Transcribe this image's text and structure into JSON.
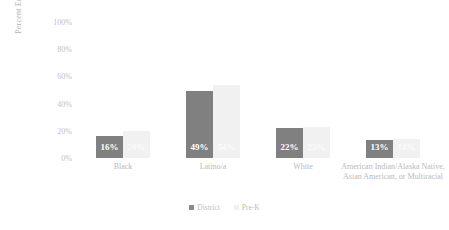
{
  "chart_data": {
    "type": "bar",
    "title": "",
    "xlabel": "",
    "ylabel": "Percent Enrollment",
    "ylim": [
      0,
      100
    ],
    "ytick_labels": [
      "100%",
      "80%",
      "60%",
      "40%",
      "20%",
      "0%"
    ],
    "ytick_values": [
      100,
      80,
      60,
      40,
      20,
      0
    ],
    "grid": false,
    "legend_position": "bottom-center",
    "categories": [
      "Black",
      "Latino/a",
      "White",
      "American Indian/Alaska Native, Asian American, or Multiracial"
    ],
    "series": [
      {
        "name": "District",
        "color": "#808080",
        "values": [
          16,
          49,
          22,
          13
        ],
        "data_labels": [
          "16%",
          "49%",
          "22%",
          "13%"
        ]
      },
      {
        "name": "Pre-K",
        "color": "#f1f1f1",
        "values": [
          20,
          54,
          23,
          14
        ],
        "data_labels": [
          "20%",
          "54%",
          "23%",
          "14%"
        ]
      }
    ]
  },
  "legend": {
    "items": [
      {
        "label": "District"
      },
      {
        "label": "Pre-K"
      }
    ]
  }
}
